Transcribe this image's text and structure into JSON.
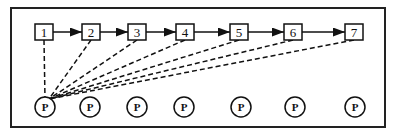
{
  "diagram": {
    "nodes": [
      {
        "label": "1",
        "x": 44,
        "p_x": 45
      },
      {
        "label": "2",
        "x": 91,
        "p_x": 90
      },
      {
        "label": "3",
        "x": 137,
        "p_x": 137
      },
      {
        "label": "4",
        "x": 185,
        "p_x": 184
      },
      {
        "label": "5",
        "x": 239,
        "p_x": 241
      },
      {
        "label": "6",
        "x": 293,
        "p_x": 295
      },
      {
        "label": "7",
        "x": 354,
        "p_x": 355
      }
    ],
    "processor_label": "P",
    "edge_style": {
      "chain": "solid-arrow",
      "links": "dashed"
    },
    "colors": {
      "stroke": "#111111",
      "background": "#ffffff"
    }
  }
}
